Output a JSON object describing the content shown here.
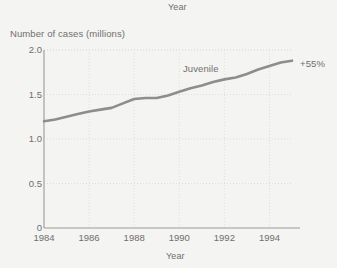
{
  "labels": {
    "top_year": "Year",
    "y_axis_title": "Number of cases (millions)",
    "x_axis_title": "Year",
    "series_label": "Juvenile",
    "growth_annotation": "+55%"
  },
  "colors": {
    "background": "#f4f4f2",
    "line": "#8d8d8d",
    "grid": "#dedede",
    "axis": "#9a9a9a",
    "text": "#6f6f6f"
  },
  "chart_data": {
    "type": "line",
    "title": "Year",
    "xlabel": "Year",
    "ylabel": "Number of cases (millions)",
    "xlim": [
      1984,
      1995
    ],
    "ylim": [
      0,
      2.0
    ],
    "grid": true,
    "legend_position": "inline-label",
    "ytick_labels": [
      "0",
      "0.5",
      "1.0",
      "1.5",
      "2.0"
    ],
    "ytick_values": [
      0,
      0.5,
      1.0,
      1.5,
      2.0
    ],
    "xtick_labels": [
      "1984",
      "1986",
      "1988",
      "1990",
      "1992",
      "1994"
    ],
    "xtick_values": [
      1984,
      1986,
      1988,
      1990,
      1992,
      1994
    ],
    "annotations": [
      {
        "text": "+55%",
        "x": 1995,
        "y": 1.88
      },
      {
        "text": "Juvenile",
        "x": 1990.3,
        "y": 1.72
      }
    ],
    "series": [
      {
        "name": "Juvenile",
        "color": "#8d8d8d",
        "x": [
          1984,
          1984.5,
          1985,
          1985.5,
          1986,
          1986.5,
          1987,
          1987.5,
          1988,
          1988.5,
          1989,
          1989.5,
          1990,
          1990.5,
          1991,
          1991.5,
          1992,
          1992.5,
          1993,
          1993.5,
          1994,
          1994.5,
          1995
        ],
        "values": [
          1.2,
          1.22,
          1.25,
          1.28,
          1.31,
          1.33,
          1.35,
          1.4,
          1.45,
          1.46,
          1.46,
          1.49,
          1.53,
          1.57,
          1.6,
          1.64,
          1.67,
          1.69,
          1.73,
          1.78,
          1.82,
          1.86,
          1.88
        ]
      }
    ]
  }
}
